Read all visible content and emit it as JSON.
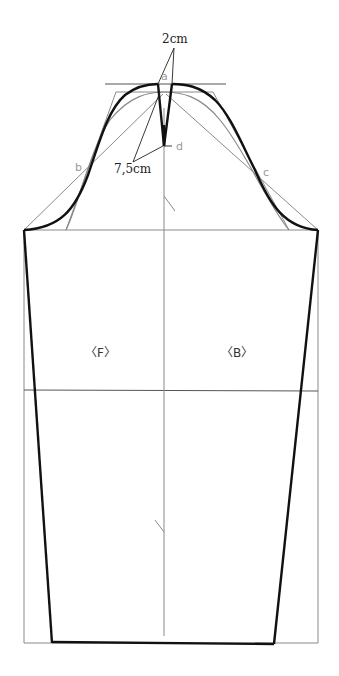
{
  "diagram": {
    "type": "sleeve-pattern-draft",
    "labels": {
      "dimension_top": "2cm",
      "dimension_dart": "7,5cm",
      "point_a": "a",
      "point_b": "b",
      "point_c": "c",
      "point_d": "d",
      "front": "〈F〉",
      "back": "〈B〉"
    },
    "colors": {
      "outline": "#111111",
      "guide": "#8a8a8a",
      "point_label": "#9a9a9a"
    }
  }
}
